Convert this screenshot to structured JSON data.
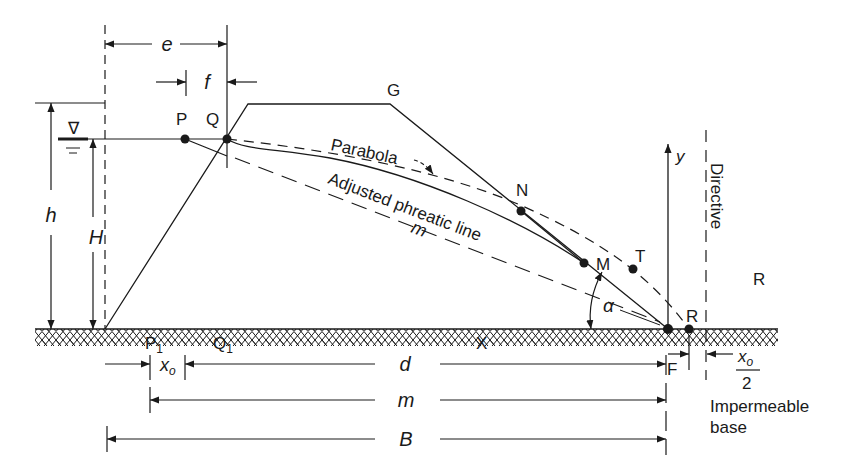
{
  "figure": {
    "points": {
      "P": "P",
      "Q": "Q",
      "G": "G",
      "N": "N",
      "M": "M",
      "T": "T",
      "R_focus": "R",
      "R_region": "R",
      "P1": "P",
      "P1_sub": "1",
      "Q1": "Q",
      "Q1_sub": "1",
      "X": "X",
      "F": "F"
    },
    "curve_labels": {
      "parabola": "Parabola",
      "adjusted": "Adjusted phreatic line",
      "m_line": "m"
    },
    "axis": {
      "y": "y",
      "directive": "Directive"
    },
    "dimensions": {
      "e": "e",
      "f": "f",
      "h": "h",
      "H": "H",
      "x0": "x",
      "x0_sub": "o",
      "d": "d",
      "m": "m",
      "B": "B",
      "alpha": "α",
      "x0_half_num": "x",
      "x0_half_num_sub": "o",
      "x0_half_den": "2"
    },
    "base_label": [
      "Impermeable",
      "base"
    ],
    "water_symbol": "∇",
    "colors": {
      "line": "#1a1a1a",
      "background": "#ffffff"
    }
  }
}
